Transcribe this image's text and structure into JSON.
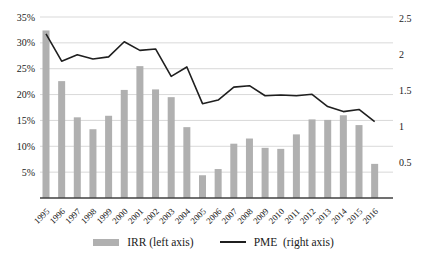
{
  "chart_data": {
    "type": "bar",
    "subtype": "dual-axis bar + line combo",
    "title": "",
    "categories": [
      "1995",
      "1996",
      "1997",
      "1998",
      "1999",
      "2000",
      "2001",
      "2002",
      "2003",
      "2004",
      "2005",
      "2006",
      "2007",
      "2008",
      "2009",
      "2010",
      "2011",
      "2012",
      "2013",
      "2014",
      "2015",
      "2016"
    ],
    "series": [
      {
        "name": "IRR (left axis)",
        "type": "bar",
        "axis": "left",
        "unit": "percent",
        "values": [
          32.4,
          22.6,
          15.6,
          13.3,
          15.9,
          20.9,
          25.5,
          21.0,
          19.5,
          13.7,
          4.4,
          5.6,
          10.5,
          11.5,
          9.7,
          9.5,
          12.3,
          15.2,
          15.1,
          16.0,
          14.1,
          6.6
        ]
      },
      {
        "name": "PME  (right axis)",
        "type": "line",
        "axis": "right",
        "unit": "multiple",
        "values": [
          2.28,
          1.9,
          1.99,
          1.93,
          1.96,
          2.17,
          2.05,
          2.07,
          1.69,
          1.82,
          1.31,
          1.36,
          1.54,
          1.56,
          1.42,
          1.43,
          1.42,
          1.44,
          1.27,
          1.2,
          1.23,
          1.06
        ]
      }
    ],
    "left_axis": {
      "min": 0,
      "max": 35,
      "tick_step": 5,
      "ticks": [
        "5%",
        "10%",
        "15%",
        "20%",
        "25%",
        "30%",
        "35%"
      ],
      "format": "percent"
    },
    "right_axis": {
      "min": 0,
      "max": 2.5,
      "tick_step": 0.5,
      "ticks": [
        "0.5",
        "1",
        "1.5",
        "2",
        "2.5"
      ]
    },
    "grid": {
      "horizontal": true,
      "vertical": false
    },
    "legend_position": "bottom",
    "xlabel": "",
    "ylabel": ""
  },
  "colors": {
    "bar": "#b0b0b0",
    "line": "#1f1f1f",
    "grid": "#d9d9d9",
    "axis_line": "#404040",
    "text": "#1a1a1a",
    "background": "#ffffff"
  }
}
